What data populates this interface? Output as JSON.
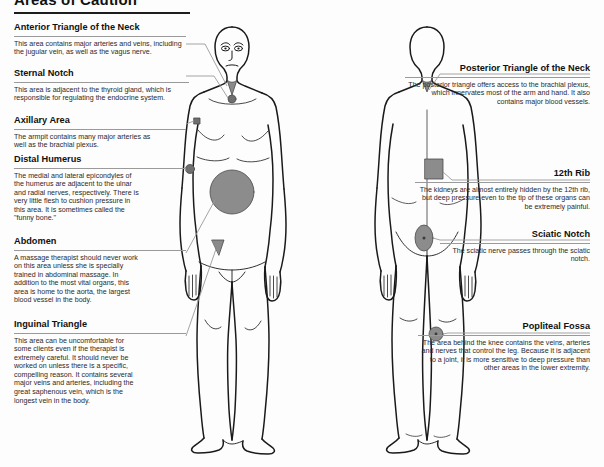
{
  "page": {
    "title": "Areas of Caution",
    "background": "#fdfdfd",
    "ink": "#1a1a1a",
    "marker_color": "#808080",
    "rule_color": "#9a9a9a"
  },
  "left_column": [
    {
      "name": "anterior-triangle-of-the-neck",
      "heading": "Anterior Triangle of the Neck",
      "body": "This area contains major arteries and veins, including the jugular vein, as well as the vagus nerve."
    },
    {
      "name": "sternal-notch",
      "heading": "Sternal Notch",
      "body": "This area is adjacent to the thyroid gland, which is responsible for regulating the endocrine system."
    },
    {
      "name": "axillary-area",
      "heading": "Axillary Area",
      "body": "The armpit contains many major arteries as well as the brachial plexus."
    },
    {
      "name": "distal-humerus",
      "heading": "Distal Humerus",
      "body": "The medial and lateral epicondyles of the humerus are adjacent to the ulnar and radial nerves, respectively. There is very little flesh to cushion pressure in this area. It is sometimes called the \"funny bone.\""
    },
    {
      "name": "abdomen",
      "heading": "Abdomen",
      "body": "A massage therapist should never work on this area unless she is specially trained in abdominal massage. In addition to the most vital organs, this area is home to the aorta, the largest blood vessel in the body."
    },
    {
      "name": "inguinal-triangle",
      "heading": "Inguinal Triangle",
      "body": "This area can be uncomfortable for some clients even if the therapist is extremely careful. It should never be worked on unless there is a specific, compelling reason. It contains several major veins and arteries, including the great saphenous vein, which is the longest vein in the body."
    }
  ],
  "right_column": [
    {
      "name": "posterior-triangle-of-the-neck",
      "heading": "Posterior Triangle of the Neck",
      "body": "The posterior triangle offers access to the brachial plexus, which innervates most of the arm and hand. It also contains major blood vessels."
    },
    {
      "name": "twelfth-rib",
      "heading": "12th Rib",
      "body": "The kidneys are almost entirely hidden by the 12th rib, but deep pressure even to the tip of these organs can be extremely painful."
    },
    {
      "name": "sciatic-notch",
      "heading": "Sciatic Notch",
      "body": "The sciatic nerve passes through the sciatic notch."
    },
    {
      "name": "popliteal-fossa",
      "heading": "Popliteal Fossa",
      "body": "The area behind the knee contains the veins, arteries and nerves that control the leg. Because it is adjacent to a joint, it is more sensitive to deep pressure than other areas in the lower extremity."
    }
  ],
  "figures": [
    {
      "name": "anterior-body-figure",
      "view": "front"
    },
    {
      "name": "posterior-body-figure",
      "view": "back"
    }
  ],
  "markers": [
    {
      "name": "marker-anterior-triangle",
      "shape": "wedge",
      "figure": "front"
    },
    {
      "name": "marker-sternal-notch",
      "shape": "circle",
      "figure": "front"
    },
    {
      "name": "marker-axillary-area",
      "shape": "square",
      "figure": "front"
    },
    {
      "name": "marker-distal-humerus",
      "shape": "circle",
      "figure": "front"
    },
    {
      "name": "marker-abdomen",
      "shape": "circle-large",
      "figure": "front"
    },
    {
      "name": "marker-inguinal-triangle",
      "shape": "triangle",
      "figure": "front"
    },
    {
      "name": "marker-posterior-triangle",
      "shape": "wedge",
      "figure": "back"
    },
    {
      "name": "marker-12th-rib",
      "shape": "square-large",
      "figure": "back"
    },
    {
      "name": "marker-sciatic-notch",
      "shape": "ellipse",
      "figure": "back"
    },
    {
      "name": "marker-popliteal-fossa",
      "shape": "circle",
      "figure": "back"
    }
  ]
}
